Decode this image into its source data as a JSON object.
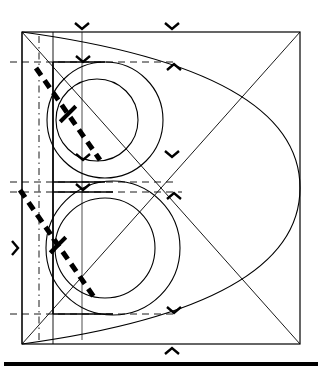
{
  "document": {
    "title": "Geometric construction of the letter B",
    "kind": "line-drawing",
    "background_color": "#ffffff",
    "ink_color": "#000000",
    "width": 323,
    "height": 380
  },
  "canvas": {
    "width": 323,
    "height": 380
  },
  "construction_square": {
    "label": "bounding-square",
    "x": 22,
    "y": 32,
    "width": 278,
    "height": 312,
    "stroke_width": 1.2,
    "color": "#000000"
  },
  "diagonals": [
    {
      "label": "diagonal-tl-br",
      "x1": 22,
      "y1": 32,
      "x2": 300,
      "y2": 344
    },
    {
      "label": "diagonal-bl-tr",
      "x1": 22,
      "y1": 344,
      "x2": 300,
      "y2": 32
    }
  ],
  "major_arcs": [
    {
      "label": "great-arc-upper",
      "d": "M 22 32 Q 300 70 300 188",
      "note": "sweeps from top-left corner to right-edge midpoint"
    },
    {
      "label": "great-arc-lower",
      "d": "M 300 188 Q 300 306 22 344",
      "note": "sweeps from right-edge midpoint to bottom-left corner"
    }
  ],
  "letter": {
    "glyph": "B",
    "stem": {
      "label": "stem",
      "x": 53,
      "y_top": 62,
      "y_bottom": 314,
      "width": 1.6
    },
    "upper_bowl": {
      "label": "upper-bowl-outer",
      "cx": 105,
      "cy": 120,
      "r": 58,
      "inner_r": 41,
      "inner_cx": 97,
      "inner_cy": 120
    },
    "lower_bowl": {
      "label": "lower-bowl-outer",
      "cx": 113,
      "cy": 248,
      "r": 67,
      "inner_r": 50,
      "inner_cx": 105,
      "inner_cy": 248
    },
    "cap_line_y": 62,
    "waist_line_y": 182,
    "waist_line2_y": 192,
    "baseline_y": 314
  },
  "vertical_guides": [
    {
      "label": "guide-left-solid",
      "x": 22,
      "y1": 32,
      "y2": 344,
      "style": "solid"
    },
    {
      "label": "guide-centre-dashdot",
      "x": 39,
      "y1": 36,
      "y2": 340,
      "style": "dash-dot"
    },
    {
      "label": "guide-stem-solid",
      "x": 53,
      "y1": 32,
      "y2": 344,
      "style": "solid"
    },
    {
      "label": "guide-inner-thin",
      "x": 82,
      "y1": 32,
      "y2": 340,
      "style": "solid-thin"
    }
  ],
  "horizontal_guides": [
    {
      "label": "guide-cap",
      "y": 62,
      "x1": 10,
      "x2": 175,
      "style": "dashed"
    },
    {
      "label": "guide-waist-upper",
      "y": 182,
      "x1": 10,
      "x2": 178,
      "style": "dashed"
    },
    {
      "label": "guide-waist-lower",
      "y": 192,
      "x1": 10,
      "x2": 182,
      "style": "dashed"
    },
    {
      "label": "guide-baseline",
      "y": 314,
      "x1": 10,
      "x2": 178,
      "style": "dashed"
    }
  ],
  "stroke_width_indicators": [
    {
      "label": "upper-stroke-width-diagonal",
      "x1": 36,
      "y1": 68,
      "x2": 100,
      "y2": 160,
      "dash": "9 6",
      "width": 5,
      "tick": {
        "cx": 68,
        "cy": 114,
        "length": 22,
        "angle": -45
      }
    },
    {
      "label": "lower-stroke-width-diagonal",
      "x1": 20,
      "y1": 190,
      "x2": 96,
      "y2": 300,
      "dash": "9 6",
      "width": 5,
      "tick": {
        "cx": 58,
        "cy": 245,
        "length": 22,
        "angle": -45
      }
    }
  ],
  "chevron_markers": [
    {
      "label": "chevron-top-stem",
      "x": 82,
      "y": 29,
      "dir": "down"
    },
    {
      "label": "chevron-top-right",
      "x": 172,
      "y": 29,
      "dir": "down"
    },
    {
      "label": "chevron-cap-stem",
      "x": 83,
      "y": 62,
      "dir": "down"
    },
    {
      "label": "chevron-cap-right",
      "x": 174,
      "y": 64,
      "dir": "up"
    },
    {
      "label": "chevron-waist-stem",
      "x": 83,
      "y": 160,
      "dir": "down"
    },
    {
      "label": "chevron-waist-right",
      "x": 172,
      "y": 157,
      "dir": "down"
    },
    {
      "label": "chevron-midband-stem",
      "x": 83,
      "y": 190,
      "dir": "down"
    },
    {
      "label": "chevron-midband-right",
      "x": 174,
      "y": 193,
      "dir": "up"
    },
    {
      "label": "chevron-baseline-right",
      "x": 174,
      "y": 313,
      "dir": "down"
    },
    {
      "label": "chevron-bottom-centre",
      "x": 172,
      "y": 348,
      "dir": "up"
    },
    {
      "label": "chevron-left-middle",
      "x": 18,
      "y": 248,
      "dir": "right"
    },
    {
      "label": "chevron-inner-middle",
      "x": 58,
      "y": 246,
      "dir": "right"
    }
  ],
  "rule": {
    "label": "bottom-rule",
    "x1": 4,
    "x2": 318,
    "y": 364,
    "thickness": 4,
    "color": "#000000"
  }
}
